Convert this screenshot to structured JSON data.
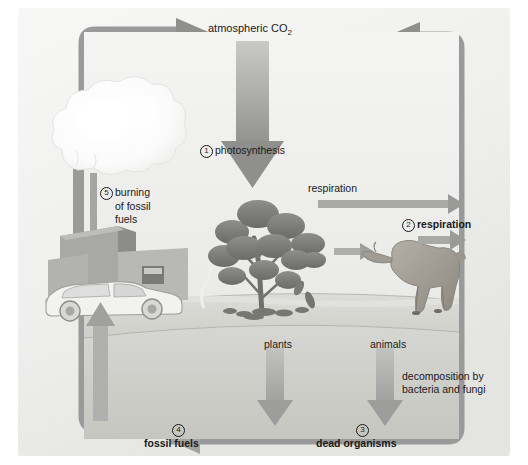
{
  "diagram": {
    "title_concept": "carbon cycle",
    "background_color": "#f2f2f0",
    "arrow_color": "#9a9a9a",
    "arrow_color_dark": "#8b8b8b",
    "text_color": "#1a1a1a"
  },
  "labels": {
    "atmospheric_co2": "atmospheric CO",
    "atmospheric_co2_sub": "2",
    "photosynthesis": "photosynthesis",
    "photosynthesis_num": "1",
    "respiration_plain": "respiration",
    "respiration_animal": "respiration",
    "respiration_animal_num": "2",
    "burning_line1": "burning",
    "burning_line2": "of fossil",
    "burning_line3": "fuels",
    "burning_num": "5",
    "plants": "plants",
    "animals": "animals",
    "decomposition_line1": "decomposition by",
    "decomposition_line2": "bacteria and fungi",
    "dead_organisms": "dead organisms",
    "dead_organisms_num": "3",
    "fossil_fuels": "fossil fuels",
    "fossil_fuels_num": "4"
  },
  "scene": {
    "factory": "factory-with-smokestacks",
    "smoke": "smoke-cloud",
    "car": "automobile",
    "tree": "tree-shrub",
    "deer": "deer-animal",
    "ground": "ground-surface",
    "underground": "underground-layer"
  }
}
